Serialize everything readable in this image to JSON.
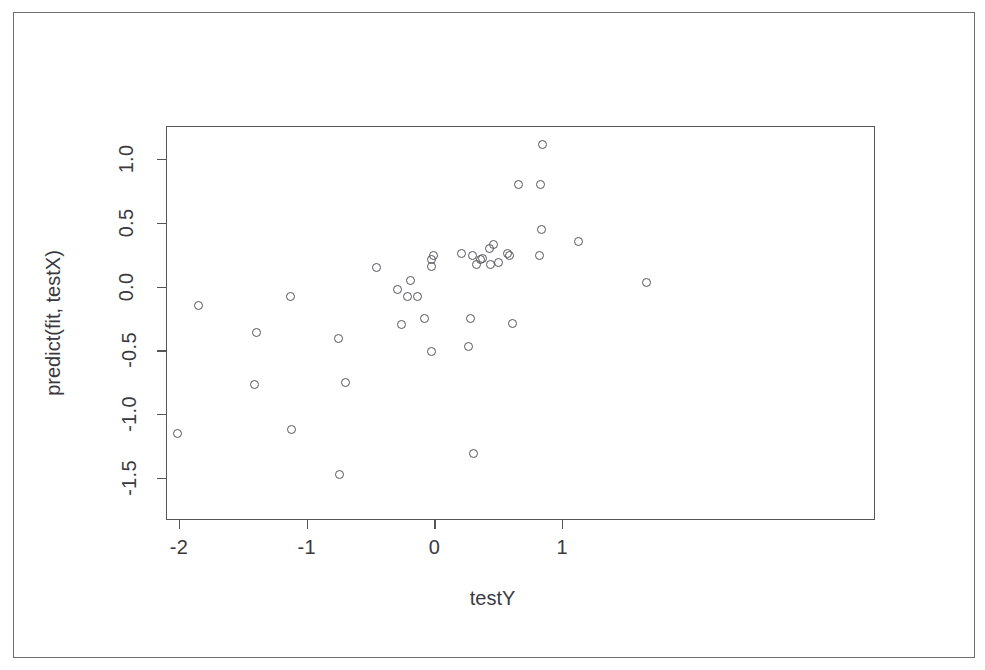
{
  "chart_data": {
    "type": "scatter",
    "title": "",
    "xlabel": "testY",
    "ylabel": "predict(fit, testX)",
    "xlim": [
      -2.1,
      1.73
    ],
    "ylim": [
      -1.55,
      1.14
    ],
    "grid": false,
    "legend": null,
    "marker": "open-circle",
    "marker_color": "#55555a",
    "xticks": [
      -2,
      -1,
      0,
      1
    ],
    "xticklabels": [
      "-2",
      "-1",
      "0",
      "1"
    ],
    "yticks": [
      -1.5,
      -1.0,
      -0.5,
      0.0,
      0.5,
      1.0
    ],
    "yticklabels": [
      "-1.5",
      "-1.0",
      "-0.5",
      "0.0",
      "0.5",
      "1.0"
    ],
    "n_points": 42,
    "points": [
      {
        "x": -2.01,
        "y": -1.15
      },
      {
        "x": -1.85,
        "y": -0.15
      },
      {
        "x": -1.39,
        "y": -0.36
      },
      {
        "x": -1.41,
        "y": -0.77
      },
      {
        "x": -1.13,
        "y": -0.08
      },
      {
        "x": -1.12,
        "y": -1.12
      },
      {
        "x": -0.75,
        "y": -0.41
      },
      {
        "x": -0.7,
        "y": -0.75
      },
      {
        "x": -0.74,
        "y": -1.47
      },
      {
        "x": -0.45,
        "y": 0.15
      },
      {
        "x": -0.29,
        "y": -0.02
      },
      {
        "x": -0.19,
        "y": 0.05
      },
      {
        "x": -0.21,
        "y": -0.08
      },
      {
        "x": -0.26,
        "y": -0.3
      },
      {
        "x": -0.13,
        "y": -0.08
      },
      {
        "x": -0.02,
        "y": 0.21
      },
      {
        "x": -0.02,
        "y": 0.16
      },
      {
        "x": -0.01,
        "y": 0.24
      },
      {
        "x": -0.08,
        "y": -0.25
      },
      {
        "x": -0.02,
        "y": -0.51
      },
      {
        "x": 0.21,
        "y": 0.26
      },
      {
        "x": 0.3,
        "y": 0.24
      },
      {
        "x": 0.38,
        "y": 0.22
      },
      {
        "x": 0.43,
        "y": 0.3
      },
      {
        "x": 0.33,
        "y": 0.17
      },
      {
        "x": 0.44,
        "y": 0.17
      },
      {
        "x": 0.28,
        "y": -0.25
      },
      {
        "x": 0.27,
        "y": -0.47
      },
      {
        "x": 0.31,
        "y": -1.31
      },
      {
        "x": 0.57,
        "y": 0.26
      },
      {
        "x": 0.59,
        "y": 0.24
      },
      {
        "x": 0.61,
        "y": -0.29
      },
      {
        "x": 0.66,
        "y": 0.8
      },
      {
        "x": 0.83,
        "y": 0.8
      },
      {
        "x": 0.85,
        "y": 1.11
      },
      {
        "x": 0.84,
        "y": 0.45
      },
      {
        "x": 0.82,
        "y": 0.24
      },
      {
        "x": 1.13,
        "y": 0.35
      },
      {
        "x": 1.66,
        "y": 0.03
      },
      {
        "x": 0.46,
        "y": 0.33
      },
      {
        "x": 0.36,
        "y": 0.21
      },
      {
        "x": 0.5,
        "y": 0.19
      }
    ]
  },
  "axes": {
    "x_title": "testY",
    "y_title": "predict(fit, testX)",
    "x_tick_labels": [
      "-2",
      "-1",
      "0",
      "1"
    ],
    "y_tick_labels": [
      "1.0",
      "0.5",
      "0.0",
      "-0.5",
      "-1.0",
      "-1.5"
    ]
  }
}
